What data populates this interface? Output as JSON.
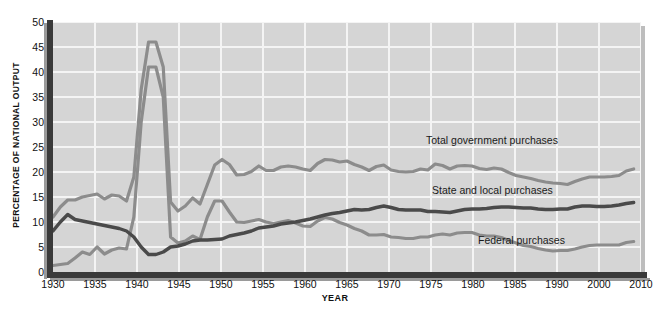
{
  "chart_data": {
    "type": "line",
    "title": "",
    "xlabel": "YEAR",
    "ylabel": "PERCENTAGE OF NATIONAL OUTPUT",
    "xlim": [
      1930,
      2010
    ],
    "ylim": [
      0,
      50
    ],
    "yticks": [
      0,
      5,
      10,
      15,
      20,
      25,
      30,
      35,
      40,
      45,
      50
    ],
    "xticks": [
      1930,
      1935,
      1940,
      1945,
      1950,
      1955,
      1960,
      1965,
      1970,
      1975,
      1980,
      1985,
      1990,
      2000,
      2010
    ],
    "grid": true,
    "legend_position": "inline-annotations",
    "colors": {
      "total": "#8c8c8c",
      "federal": "#8c8c8c",
      "state_local": "#4a4a4a",
      "plot_background": "#d5d5d5",
      "gridline": "#f4f4f4",
      "axis": "#3a3a3a"
    },
    "annotations": [
      {
        "text": "Total government purchases",
        "series": "Total government purchases"
      },
      {
        "text": "State and local purchases",
        "series": "State and local purchases"
      },
      {
        "text": "Federal purchases",
        "series": "Federal purchases"
      }
    ],
    "x": [
      1930,
      1931,
      1932,
      1933,
      1934,
      1935,
      1936,
      1937,
      1938,
      1939,
      1940,
      1941,
      1942,
      1943,
      1944,
      1945,
      1946,
      1947,
      1948,
      1949,
      1950,
      1951,
      1952,
      1953,
      1954,
      1955,
      1956,
      1957,
      1958,
      1959,
      1960,
      1961,
      1962,
      1963,
      1964,
      1965,
      1966,
      1967,
      1968,
      1969,
      1970,
      1971,
      1972,
      1973,
      1974,
      1975,
      1976,
      1977,
      1978,
      1979,
      1980,
      1981,
      1982,
      1983,
      1984,
      1985,
      1986,
      1987,
      1988,
      1989,
      1990,
      1991,
      1992,
      1993,
      1994,
      1995,
      1996,
      1997,
      1998,
      1999,
      2000,
      2001,
      2002,
      2003,
      2004,
      2005,
      2006,
      2007,
      2008,
      2009
    ],
    "series": [
      {
        "name": "Total government purchases",
        "values": [
          11.0,
          13.0,
          14.4,
          14.4,
          15.0,
          15.3,
          15.6,
          14.6,
          15.4,
          15.2,
          14.2,
          19.0,
          36.5,
          46.0,
          46.0,
          41.0,
          14.0,
          12.2,
          13.2,
          14.8,
          13.6,
          17.5,
          21.4,
          22.5,
          21.5,
          19.4,
          19.5,
          20.1,
          21.2,
          20.3,
          20.3,
          21.0,
          21.2,
          21.0,
          20.6,
          20.3,
          21.7,
          22.5,
          22.4,
          22.0,
          22.2,
          21.5,
          21.0,
          20.3,
          21.1,
          21.4,
          20.4,
          20.1,
          20.0,
          20.1,
          20.6,
          20.4,
          21.6,
          21.3,
          20.6,
          21.2,
          21.3,
          21.2,
          20.7,
          20.5,
          20.8,
          20.6,
          19.9,
          19.3,
          19.0,
          18.7,
          18.3,
          18.0,
          17.8,
          17.7,
          17.5,
          18.1,
          18.6,
          19.0,
          19.0,
          19.0,
          19.1,
          19.3,
          20.2,
          20.6
        ]
      },
      {
        "name": "Federal purchases",
        "values": [
          1.3,
          1.5,
          1.7,
          2.8,
          4.0,
          3.5,
          5.0,
          3.6,
          4.4,
          4.8,
          4.6,
          11.0,
          30.0,
          41.0,
          41.0,
          35.0,
          7.0,
          5.8,
          6.2,
          7.2,
          6.5,
          11.0,
          14.2,
          14.2,
          12.0,
          10.0,
          9.9,
          10.2,
          10.5,
          10.0,
          9.7,
          10.0,
          10.3,
          9.8,
          9.2,
          9.1,
          10.2,
          10.9,
          10.6,
          9.9,
          9.4,
          8.7,
          8.2,
          7.4,
          7.4,
          7.5,
          7.0,
          6.9,
          6.7,
          6.7,
          7.0,
          7.0,
          7.4,
          7.6,
          7.4,
          7.8,
          7.9,
          7.9,
          7.4,
          7.2,
          7.2,
          6.9,
          6.3,
          5.8,
          5.3,
          5.1,
          4.7,
          4.4,
          4.2,
          4.3,
          4.3,
          4.6,
          5.0,
          5.3,
          5.4,
          5.4,
          5.4,
          5.4,
          5.9,
          6.1
        ]
      },
      {
        "name": "State and local purchases",
        "values": [
          8.2,
          10.0,
          11.5,
          10.5,
          10.2,
          9.9,
          9.6,
          9.3,
          9.0,
          8.7,
          8.2,
          7.0,
          5.0,
          3.5,
          3.5,
          4.0,
          5.0,
          5.2,
          5.6,
          6.2,
          6.4,
          6.4,
          6.5,
          6.6,
          7.2,
          7.5,
          7.8,
          8.2,
          8.8,
          9.0,
          9.2,
          9.6,
          9.8,
          10.0,
          10.3,
          10.6,
          11.0,
          11.4,
          11.7,
          11.9,
          12.2,
          12.5,
          12.4,
          12.5,
          12.9,
          13.2,
          12.9,
          12.5,
          12.4,
          12.4,
          12.4,
          12.1,
          12.1,
          12.0,
          11.9,
          12.2,
          12.5,
          12.6,
          12.6,
          12.7,
          12.9,
          13.0,
          13.0,
          12.9,
          12.8,
          12.8,
          12.6,
          12.5,
          12.5,
          12.6,
          12.6,
          13.0,
          13.2,
          13.2,
          13.1,
          13.1,
          13.2,
          13.4,
          13.7,
          13.9
        ]
      }
    ]
  },
  "axis": {
    "y_title": "PERCENTAGE OF NATIONAL OUTPUT",
    "x_title": "YEAR",
    "y_ticks": [
      "50",
      "45",
      "40",
      "35",
      "30",
      "25",
      "20",
      "15",
      "10",
      "5",
      "0"
    ],
    "x_ticks": [
      "1930",
      "1935",
      "1940",
      "1945",
      "1950",
      "1955",
      "1960",
      "1965",
      "1970",
      "1975",
      "1980",
      "1985",
      "1990",
      "2000",
      "2010"
    ]
  },
  "labels": {
    "total": "Total government purchases",
    "state_local": "State and local purchases",
    "federal": "Federal purchases"
  }
}
